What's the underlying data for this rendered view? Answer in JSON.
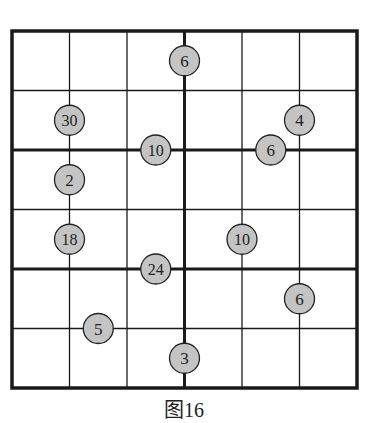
{
  "figure": {
    "caption": "图16",
    "grid": {
      "rows": 6,
      "cols": 6,
      "box_rows": 2,
      "box_cols": 3,
      "left": 12,
      "top": 31,
      "right": 357,
      "bottom": 388
    },
    "colors": {
      "line": "#1a1a1a",
      "circle_fill": "#c4c4c4",
      "circle_stroke": "#222222",
      "text": "#222222"
    },
    "clues": [
      {
        "value": "6",
        "row": 0.5,
        "col": 3.0
      },
      {
        "value": "30",
        "row": 1.5,
        "col": 1.0
      },
      {
        "value": "4",
        "row": 1.5,
        "col": 5.0
      },
      {
        "value": "10",
        "row": 2.0,
        "col": 2.5
      },
      {
        "value": "6",
        "row": 2.0,
        "col": 4.5
      },
      {
        "value": "2",
        "row": 2.5,
        "col": 1.0
      },
      {
        "value": "18",
        "row": 3.5,
        "col": 1.0
      },
      {
        "value": "10",
        "row": 3.5,
        "col": 4.0
      },
      {
        "value": "24",
        "row": 4.0,
        "col": 2.5
      },
      {
        "value": "6",
        "row": 4.5,
        "col": 5.0
      },
      {
        "value": "5",
        "row": 5.0,
        "col": 1.5
      },
      {
        "value": "3",
        "row": 5.5,
        "col": 3.0
      }
    ]
  }
}
